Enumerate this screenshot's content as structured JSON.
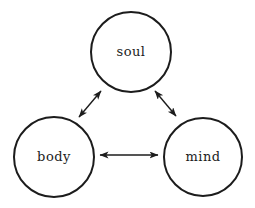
{
  "diagram": {
    "type": "node-link",
    "nodes": [
      {
        "id": "soul",
        "label": "soul",
        "position": "top-center"
      },
      {
        "id": "body",
        "label": "body",
        "position": "bottom-left"
      },
      {
        "id": "mind",
        "label": "mind",
        "position": "bottom-right"
      }
    ],
    "edges": [
      {
        "from": "soul",
        "to": "body",
        "bidirectional": true
      },
      {
        "from": "soul",
        "to": "mind",
        "bidirectional": true
      },
      {
        "from": "body",
        "to": "mind",
        "bidirectional": true
      }
    ],
    "colors": {
      "stroke": "#1c1c1c",
      "text": "#1c1c1c",
      "background": "#ffffff"
    }
  }
}
